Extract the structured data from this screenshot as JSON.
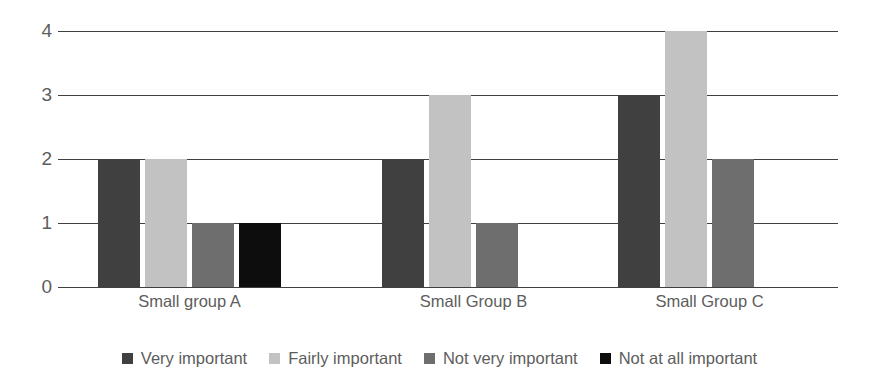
{
  "chart_data": {
    "type": "bar",
    "title": "",
    "subtitle": "",
    "xlabel": "",
    "ylabel": "",
    "ylim": [
      0,
      4
    ],
    "yticks": [
      "0",
      "1",
      "2",
      "3",
      "4"
    ],
    "grid": true,
    "legend_position": "bottom",
    "categories": [
      "Small group A",
      "Small Group B",
      "Small Group C"
    ],
    "series": [
      {
        "name": "Very important",
        "color": "#404040",
        "values": [
          2,
          2,
          3
        ]
      },
      {
        "name": "Fairly important",
        "color": "#c2c2c2",
        "values": [
          2,
          3,
          4
        ]
      },
      {
        "name": "Not very important",
        "color": "#6e6e6e",
        "values": [
          1,
          1,
          2
        ]
      },
      {
        "name": "Not at all important",
        "color": "#0d0d0d",
        "values": [
          1,
          0,
          0
        ]
      }
    ]
  },
  "axis": {
    "line_color": "#3f3f3f",
    "label_color": "#5d5d5d"
  }
}
